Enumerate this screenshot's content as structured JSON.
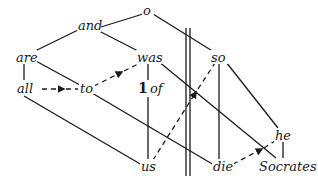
{
  "diagram": {
    "type": "sentence-diagram",
    "nodes": {
      "o": "o",
      "and": "and",
      "are": "are",
      "was": "was",
      "so": "so",
      "all": "all",
      "to": "to",
      "one": "1",
      "of": "of",
      "us": "us",
      "die": "die",
      "he": "he",
      "socrates": "Socrates"
    },
    "edges": [
      {
        "from": "o",
        "to": "and",
        "style": "solid"
      },
      {
        "from": "o",
        "to": "so",
        "style": "solid"
      },
      {
        "from": "and",
        "to": "are",
        "style": "solid"
      },
      {
        "from": "and",
        "to": "was",
        "style": "solid"
      },
      {
        "from": "are",
        "to": "all",
        "style": "solid"
      },
      {
        "from": "are",
        "to": "to",
        "style": "solid"
      },
      {
        "from": "all",
        "to": "to",
        "style": "dashed-arrow"
      },
      {
        "from": "to",
        "to": "was",
        "style": "dashed-arrow"
      },
      {
        "from": "was",
        "to": "1 of",
        "style": "solid"
      },
      {
        "from": "1 of",
        "to": "us",
        "style": "solid"
      },
      {
        "from": "was",
        "to": "Socrates",
        "style": "solid"
      },
      {
        "from": "so",
        "to": "die",
        "style": "solid"
      },
      {
        "from": "so",
        "to": "he",
        "style": "solid"
      },
      {
        "from": "us",
        "to": "so",
        "style": "dashed-arrow"
      },
      {
        "from": "to",
        "to": "die",
        "style": "solid"
      },
      {
        "from": "all",
        "to": "us",
        "style": "solid"
      },
      {
        "from": "die",
        "to": "he",
        "style": "dashed-arrow"
      },
      {
        "from": "he",
        "to": "Socrates",
        "style": "solid"
      }
    ],
    "divider": "double-vertical-line"
  }
}
